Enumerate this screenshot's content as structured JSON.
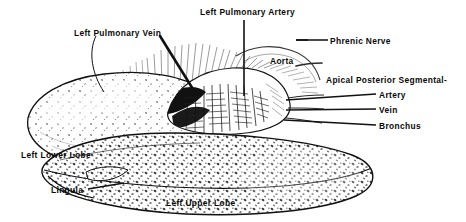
{
  "figure": {
    "background": "#ffffff",
    "ink": "#111111"
  },
  "labels": [
    {
      "id": "left-pulmonary-vein",
      "text": "Left Pulmonary Vein",
      "x": 74,
      "y": 29,
      "leader": "curve-down-left-and-arrow-down-right"
    },
    {
      "id": "left-pulmonary-artery",
      "text": "Left Pulmonary Artery",
      "x": 200,
      "y": 8,
      "leader": "vertical-down"
    },
    {
      "id": "phrenic-nerve",
      "text": "Phrenic Nerve",
      "x": 330,
      "y": 37,
      "leader": "horizontal-left"
    },
    {
      "id": "aorta",
      "text": "Aorta",
      "x": 270,
      "y": 57,
      "leader": "none"
    },
    {
      "id": "apical-posterior-segmental",
      "text": "Apical Posterior Segmental-",
      "x": 326,
      "y": 76,
      "leader": "none"
    },
    {
      "id": "artery",
      "text": "Artery",
      "x": 379,
      "y": 91,
      "leader": "horizontal-left"
    },
    {
      "id": "vein",
      "text": "Vein",
      "x": 379,
      "y": 106,
      "leader": "horizontal-left"
    },
    {
      "id": "bronchus",
      "text": "Bronchus",
      "x": 379,
      "y": 122,
      "leader": "horizontal-left"
    },
    {
      "id": "left-lower-lobe",
      "text": "Left Lower Lobe",
      "x": 21,
      "y": 151,
      "leader": "none"
    },
    {
      "id": "lingula",
      "text": "Lingula",
      "x": 51,
      "y": 186,
      "leader": "horizontal-right"
    },
    {
      "id": "left-upper-lobe",
      "text": "Left Upper Lobe",
      "x": 166,
      "y": 199,
      "leader": "none"
    }
  ],
  "structures": [
    {
      "id": "left-lower-lobe-body",
      "name": "Left Lower Lobe"
    },
    {
      "id": "left-upper-lobe-body",
      "name": "Left Upper Lobe"
    },
    {
      "id": "lingula-body",
      "name": "Lingula"
    },
    {
      "id": "hilum",
      "name": "Hilar vessel bundle"
    },
    {
      "id": "mediastinal-fringe",
      "name": "Mediastinal hatching"
    },
    {
      "id": "oblique-fissure",
      "name": "Oblique fissure"
    }
  ]
}
